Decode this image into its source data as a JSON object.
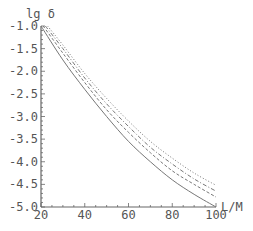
{
  "chart_data": {
    "type": "line",
    "title": "",
    "xlabel": "L/M",
    "ylabel": "lg δ",
    "xlim": [
      20,
      100
    ],
    "ylim": [
      -5.0,
      -1.0
    ],
    "grid": false,
    "legend": null,
    "xticks": [
      20,
      40,
      60,
      80,
      100
    ],
    "xtick_labels": [
      "20",
      "40",
      "60",
      "80",
      "100"
    ],
    "yticks": [
      -1.0,
      -1.5,
      -2.0,
      -2.5,
      -3.0,
      -3.5,
      -4.0,
      -4.5,
      -5.0
    ],
    "ytick_labels": [
      "-1.0",
      "-1.5",
      "-2.0",
      "-2.5",
      "-3.0",
      "-3.5",
      "-4.0",
      "-4.5",
      "-5.0"
    ],
    "series": [
      {
        "name": "solid",
        "style": "solid",
        "x": [
          20,
          30,
          40,
          50,
          60,
          70,
          80,
          90,
          100
        ],
        "y": [
          -1.0,
          -1.75,
          -2.4,
          -3.0,
          -3.55,
          -4.0,
          -4.4,
          -4.72,
          -5.0
        ]
      },
      {
        "name": "dashed",
        "style": "dashed",
        "x": [
          21,
          30,
          40,
          50,
          60,
          70,
          80,
          90,
          100
        ],
        "y": [
          -1.0,
          -1.6,
          -2.25,
          -2.85,
          -3.35,
          -3.8,
          -4.2,
          -4.5,
          -4.78
        ]
      },
      {
        "name": "dash-dot",
        "style": "dashdot",
        "x": [
          22,
          30,
          40,
          50,
          60,
          70,
          80,
          90,
          100
        ],
        "y": [
          -1.0,
          -1.5,
          -2.15,
          -2.72,
          -3.22,
          -3.68,
          -4.05,
          -4.38,
          -4.65
        ]
      },
      {
        "name": "dotted",
        "style": "dotted",
        "x": [
          23,
          30,
          40,
          50,
          60,
          70,
          80,
          90,
          100
        ],
        "y": [
          -1.0,
          -1.42,
          -2.05,
          -2.6,
          -3.1,
          -3.55,
          -3.92,
          -4.25,
          -4.52
        ]
      }
    ]
  }
}
